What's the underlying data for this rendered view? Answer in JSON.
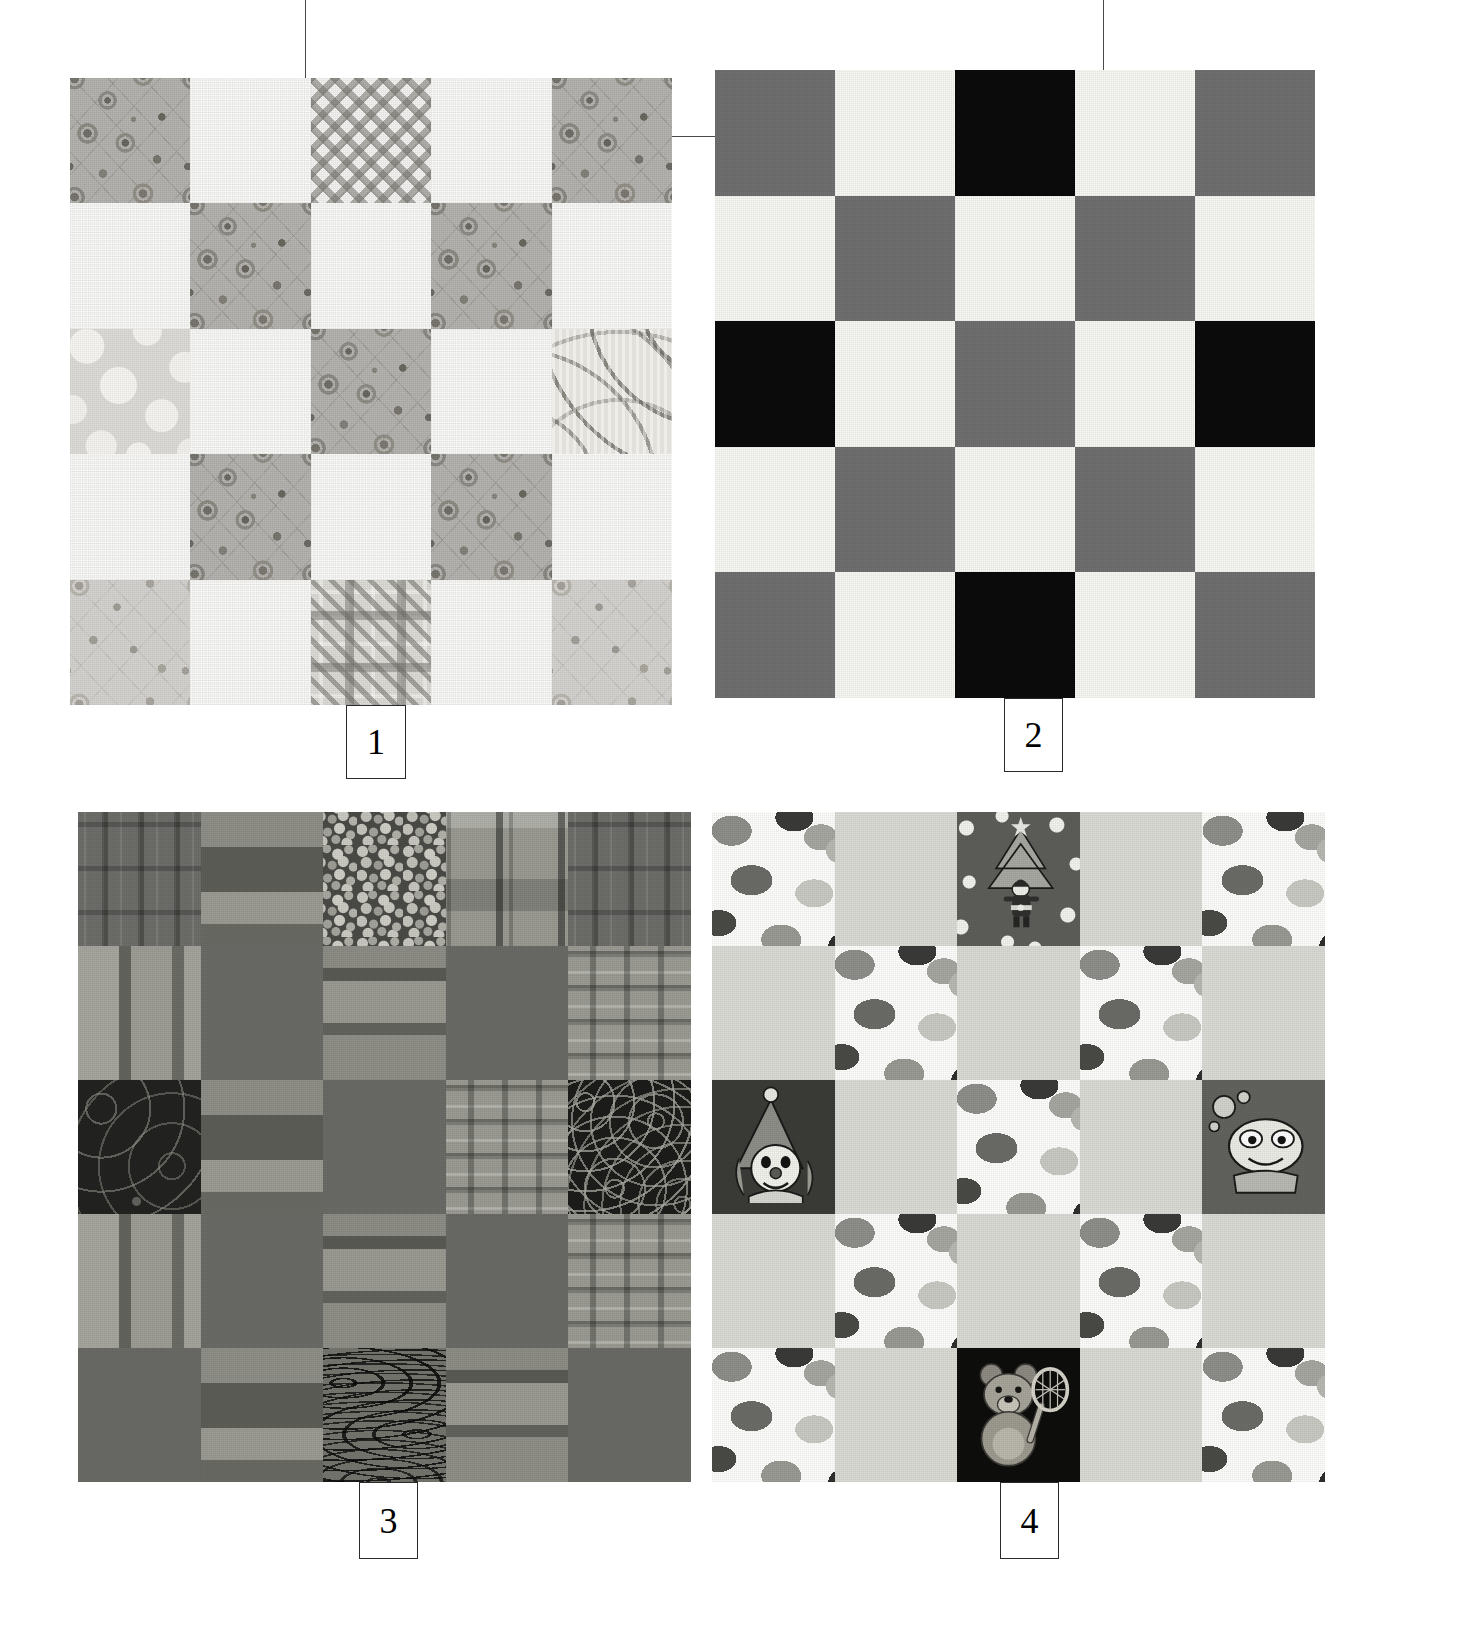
{
  "figure": {
    "background_color": "#ffffff",
    "line_color": "#4a4a4a",
    "callout_border_color": "#2b2b2b"
  },
  "callouts": [
    {
      "id": "callout-1",
      "label": "1"
    },
    {
      "id": "callout-2",
      "label": "2"
    },
    {
      "id": "callout-3",
      "label": "3"
    },
    {
      "id": "callout-4",
      "label": "4"
    }
  ],
  "blocks": [
    {
      "number": "1",
      "name": "grey-floral-calico-checkerboard",
      "rows": 5,
      "cols": 5,
      "patches": [
        "floral",
        "muslin",
        "gingham",
        "muslin",
        "floral",
        "muslin",
        "floral",
        "muslin",
        "floral",
        "muslin",
        "dots-light",
        "muslin",
        "floral",
        "muslin",
        "swirl",
        "muslin",
        "floral",
        "muslin",
        "floral",
        "muslin",
        "floral-light",
        "muslin",
        "plaid",
        "muslin",
        "floral-light"
      ]
    },
    {
      "number": "2",
      "name": "black-grey-white-solid-checkerboard",
      "rows": 5,
      "cols": 5,
      "patches": [
        "grey",
        "white",
        "black",
        "white",
        "grey",
        "white",
        "grey",
        "white",
        "grey",
        "white",
        "black",
        "white",
        "grey",
        "white",
        "black",
        "white",
        "grey",
        "white",
        "grey",
        "white",
        "grey",
        "white",
        "black",
        "white",
        "grey"
      ]
    },
    {
      "number": "3",
      "name": "dark-homespun-plaid-checkerboard",
      "rows": 5,
      "cols": 5,
      "patches": [
        "plaidA",
        "plaidB",
        "speckle",
        "plaidC",
        "plaidA",
        "plaidD",
        "solid-medium",
        "plaidE",
        "solid-medium",
        "plaidF",
        "paisley-dark",
        "plaidB",
        "solid-medium",
        "plaidF",
        "maze-dark",
        "plaidD",
        "solid-medium",
        "plaidE",
        "solid-medium",
        "plaidF",
        "solid-medium",
        "plaidB",
        "marble",
        "plaidE",
        "solid-medium"
      ]
    },
    {
      "number": "4",
      "name": "juvenile-novelty-jellybean-checkerboard",
      "rows": 5,
      "cols": 5,
      "patches": [
        "jellybean",
        "solid-light",
        "santa-print",
        "solid-light",
        "jellybean",
        "solid-light",
        "jellybean",
        "solid-light",
        "jellybean",
        "solid-light",
        "clown-print",
        "solid-light",
        "jellybean",
        "solid-light",
        "alien-print",
        "solid-light",
        "jellybean",
        "solid-light",
        "jellybean",
        "solid-light",
        "jellybean",
        "solid-light",
        "teddy-bear-print",
        "solid-light",
        "jellybean"
      ]
    }
  ],
  "palette": {
    "muslin": "#fbfbf9",
    "floral_grey": "#b8b7b4",
    "solid_black": "#0b0b0b",
    "solid_grey": "#6f6f6f",
    "solid_white": "#f7f7f4",
    "homespun_medium": "#6a6a66",
    "novelty_light": "#dbdbd6",
    "novelty_white": "#fcfcfa"
  }
}
